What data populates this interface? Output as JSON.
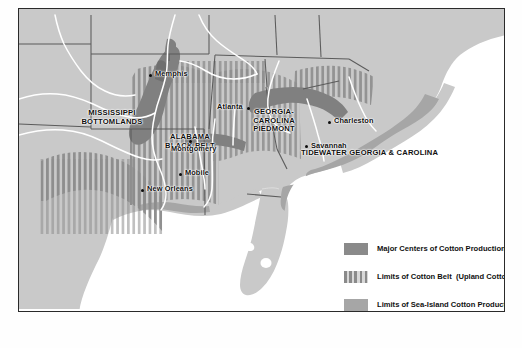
{
  "map": {
    "title": "Cotton Production in the American South",
    "regions": [
      {
        "name": "mississippi-bottomlands",
        "label": "MISSISSIPPI\nBOTTOMLANDS",
        "x": 88,
        "y": 100
      },
      {
        "name": "alabama-black-belt",
        "label": "ALABAMA\nBLACK BELT",
        "x": 170,
        "y": 124
      },
      {
        "name": "georgia-carolina-piedmont",
        "label": "GEORGIA-\nCAROLINA\nPIEDMONT",
        "x": 255,
        "y": 106
      },
      {
        "name": "tidewater-georgia-carolina",
        "label": "TIDEWATER GEORGIA & CAROLINA",
        "x": 304,
        "y": 143
      }
    ],
    "cities": [
      {
        "name": "memphis",
        "label": "Memphis",
        "dot_x": 148,
        "dot_y": 84,
        "lx": 153,
        "ly": 80,
        "side": "right"
      },
      {
        "name": "atlanta",
        "label": "Atlanta",
        "dot_x": 246,
        "dot_y": 117,
        "lx": 223,
        "ly": 113,
        "side": "left"
      },
      {
        "name": "montgomery",
        "label": "Montgomery",
        "dot_x": 186,
        "dot_y": 150,
        "lx": 172,
        "ly": 154,
        "side": "below"
      },
      {
        "name": "mobile",
        "label": "Mobile",
        "dot_x": 178,
        "dot_y": 183,
        "lx": 183,
        "ly": 179,
        "side": "right"
      },
      {
        "name": "new-orleans",
        "label": "New Orleans",
        "dot_x": 140,
        "dot_y": 199,
        "lx": 145,
        "ly": 195,
        "side": "right"
      },
      {
        "name": "charleston",
        "label": "Charleston",
        "dot_x": 327,
        "dot_y": 131,
        "lx": 332,
        "ly": 127,
        "side": "right"
      },
      {
        "name": "savannah",
        "label": "Savannah",
        "dot_x": 304,
        "dot_y": 155,
        "lx": 309,
        "ly": 152,
        "side": "right"
      }
    ]
  },
  "legend": {
    "items": [
      {
        "name": "major-centers",
        "swatch": "solid",
        "label": "Major Centers of Cotton Production"
      },
      {
        "name": "cotton-belt",
        "swatch": "stripe",
        "label": "Limits of Cotton Belt  (Upland Cotton)"
      },
      {
        "name": "sea-island",
        "swatch": "sea",
        "label": "Limits of Sea-Island Cotton Production"
      }
    ]
  },
  "caption": {
    "text": ""
  },
  "colors": {
    "land": "#c9c9c9",
    "ocean": "#ffffff",
    "major_centers": "#8a8a8a",
    "sea_island": "#a6a6a6",
    "stripe_dark": "#8a8a8a",
    "river": "#ffffff",
    "state_border": "#5a5a5a",
    "frame": "#2a2a2a",
    "text": "#101010"
  }
}
